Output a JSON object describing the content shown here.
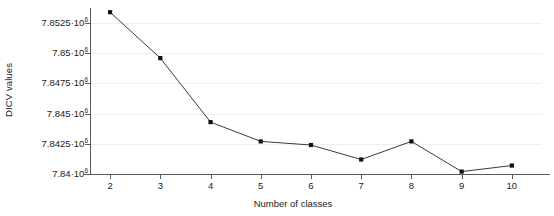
{
  "chart_data": {
    "type": "line",
    "title": "",
    "subtitle": "",
    "xlabel": "Number of classes",
    "ylabel": "DICV values",
    "x": [
      2,
      3,
      4,
      5,
      6,
      7,
      8,
      9,
      10
    ],
    "categories": [
      "2",
      "3",
      "4",
      "5",
      "6",
      "7",
      "8",
      "9",
      "10"
    ],
    "series": [
      {
        "name": "DICV",
        "values": [
          7853400,
          7849600,
          7844300,
          7842700,
          7842400,
          7841200,
          7842700,
          7840200,
          7840700
        ]
      }
    ],
    "values": [
      7853400,
      7849600,
      7844300,
      7842700,
      7842400,
      7841200,
      7842700,
      7840200,
      7840700
    ],
    "xlim": [
      1.6,
      10.6
    ],
    "ylim": [
      7840000,
      7853750
    ],
    "xticks": [
      2,
      3,
      4,
      5,
      6,
      7,
      8,
      9,
      10
    ],
    "xtick_labels": [
      "2",
      "3",
      "4",
      "5",
      "6",
      "7",
      "8",
      "9",
      "10"
    ],
    "yticks": [
      7840000,
      7842500,
      7845000,
      7847500,
      7850000,
      7852500
    ],
    "ytick_labels": [
      {
        "mantissa": "7.84·",
        "base": "10",
        "exponent": "6",
        "value": 7840000
      },
      {
        "mantissa": "7.8425·",
        "base": "10",
        "exponent": "6",
        "value": 7842500
      },
      {
        "mantissa": "7.845·",
        "base": "10",
        "exponent": "6",
        "value": 7845000
      },
      {
        "mantissa": "7.8475·",
        "base": "10",
        "exponent": "6",
        "value": 7847500
      },
      {
        "mantissa": "7.85·",
        "base": "10",
        "exponent": "6",
        "value": 7850000
      },
      {
        "mantissa": "7.8525·",
        "base": "10",
        "exponent": "6",
        "value": 7852500
      }
    ],
    "grid": true,
    "grid_axis": "y",
    "grid_color": "#eeeeee",
    "legend": false,
    "legend_position": "none",
    "line_color": "#3a3a3a",
    "marker": "square",
    "marker_color": "#111111",
    "axis_color": "#5a5a5a",
    "background_color": "#ffffff",
    "annotations": []
  }
}
